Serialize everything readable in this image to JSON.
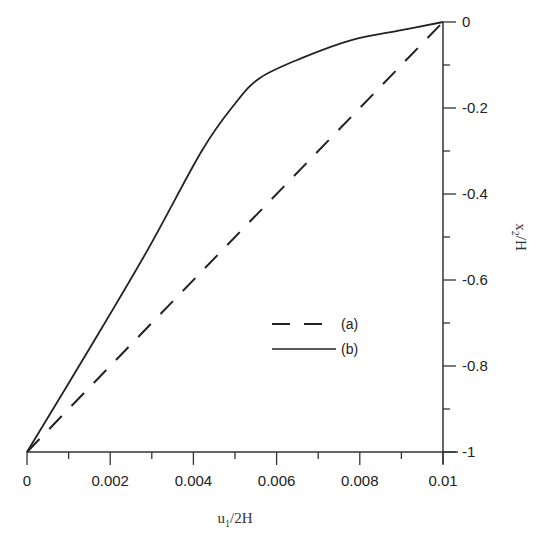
{
  "chart_data": {
    "type": "line",
    "title": "",
    "xlabel": "u1/2H",
    "ylabel": "x2/H",
    "xlim": [
      0,
      0.01
    ],
    "ylim": [
      -1,
      0
    ],
    "x_ticks": [
      "0",
      "0.002",
      "0.004",
      "0.006",
      "0.008",
      "0.01"
    ],
    "y_ticks": [
      "0",
      "-0.2",
      "-0.4",
      "-0.6",
      "-0.8",
      "-1"
    ],
    "grid": false,
    "legend_position": "center-right (inside)",
    "y_axis_side": "right",
    "series": [
      {
        "name": "(a)",
        "style": "dashed",
        "x": [
          0,
          0.01
        ],
        "y": [
          -1,
          0
        ]
      },
      {
        "name": "(b)",
        "style": "solid",
        "x": [
          0,
          0.0015,
          0.0029,
          0.0042,
          0.005,
          0.0056,
          0.0066,
          0.0078,
          0.009,
          0.01
        ],
        "y": [
          -1,
          -0.76,
          -0.53,
          -0.3,
          -0.19,
          -0.13,
          -0.084,
          -0.042,
          -0.019,
          0
        ]
      }
    ]
  },
  "axes": {
    "xlabel_main": "u",
    "xlabel_sub": "1",
    "xlabel_rest": "/2H",
    "ylabel_main": "x",
    "ylabel_sub": "2",
    "ylabel_rest": "/H"
  },
  "legend": [
    {
      "label": "(a)",
      "style": "dashed"
    },
    {
      "label": "(b)",
      "style": "solid"
    }
  ],
  "colors": {
    "line": "#222222",
    "axis": "#333333",
    "background": "#ffffff"
  }
}
